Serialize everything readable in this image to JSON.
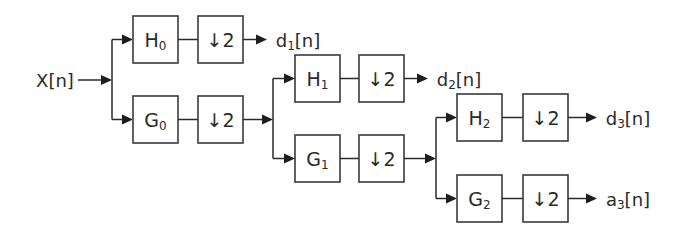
{
  "input": {
    "label": "X[n]"
  },
  "stages": [
    {
      "highpass": {
        "name": "H",
        "subscript": "0"
      },
      "lowpass": {
        "name": "G",
        "subscript": "0"
      },
      "downsample_label": "↓2",
      "detail_output": {
        "name": "d",
        "subscript": "1",
        "suffix": "[n]"
      }
    },
    {
      "highpass": {
        "name": "H",
        "subscript": "1"
      },
      "lowpass": {
        "name": "G",
        "subscript": "1"
      },
      "downsample_label": "↓2",
      "detail_output": {
        "name": "d",
        "subscript": "2",
        "suffix": "[n]"
      }
    },
    {
      "highpass": {
        "name": "H",
        "subscript": "2"
      },
      "lowpass": {
        "name": "G",
        "subscript": "2"
      },
      "downsample_label": "↓2",
      "detail_output": {
        "name": "d",
        "subscript": "3",
        "suffix": "[n]"
      },
      "approx_output": {
        "name": "a",
        "subscript": "3",
        "suffix": "[n]"
      }
    }
  ]
}
